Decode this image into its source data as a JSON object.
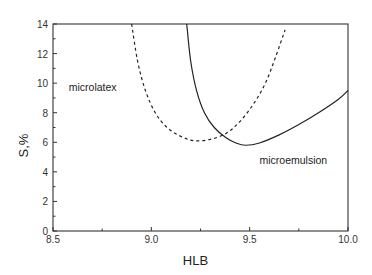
{
  "chart_data": {
    "type": "line",
    "title": "",
    "xlabel": "HLB",
    "ylabel": "S,%",
    "xlim": [
      8.5,
      10.0
    ],
    "ylim": [
      0,
      14
    ],
    "xticks": [
      "8.5",
      "9.0",
      "9.5",
      "10.0"
    ],
    "yticks": [
      "0",
      "2",
      "4",
      "6",
      "8",
      "10",
      "12",
      "14"
    ],
    "grid": false,
    "legend": "none",
    "annotations": [
      {
        "text": "microlatex",
        "x": 8.58,
        "y": 9.5
      },
      {
        "text": "microemulsion",
        "x": 9.55,
        "y": 4.5
      }
    ],
    "series": [
      {
        "name": "microlatex boundary",
        "style": "dashed",
        "x": [
          8.9,
          8.93,
          8.97,
          9.02,
          9.08,
          9.15,
          9.22,
          9.3,
          9.38,
          9.45,
          9.52,
          9.58,
          9.63,
          9.68
        ],
        "y": [
          14.0,
          11.5,
          9.5,
          8.0,
          7.0,
          6.4,
          6.1,
          6.2,
          6.6,
          7.4,
          8.6,
          10.0,
          11.7,
          13.6
        ]
      },
      {
        "name": "microemulsion boundary",
        "style": "solid",
        "x": [
          9.18,
          9.2,
          9.23,
          9.27,
          9.32,
          9.38,
          9.43,
          9.48,
          9.55,
          9.65,
          9.75,
          9.85,
          9.95,
          10.0
        ],
        "y": [
          14.0,
          11.5,
          9.5,
          8.0,
          7.0,
          6.3,
          5.95,
          5.8,
          5.95,
          6.5,
          7.2,
          8.0,
          8.9,
          9.5
        ]
      }
    ]
  }
}
